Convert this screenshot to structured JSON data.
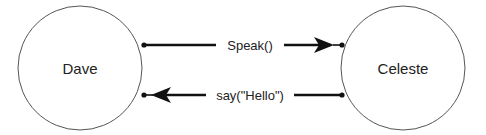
{
  "diagram": {
    "nodes": [
      {
        "id": "dave",
        "label": "Dave"
      },
      {
        "id": "celeste",
        "label": "Celeste"
      }
    ],
    "messages": [
      {
        "label": "Speak()",
        "from": "dave",
        "to": "celeste",
        "arrowhead_near": "celeste"
      },
      {
        "label": "say(\"Hello\")",
        "from": "celeste",
        "to": "dave",
        "arrowhead_near": "dave"
      }
    ],
    "colors": {
      "stroke": "#111111",
      "circle_stroke": "#555555",
      "background": "#ffffff"
    }
  }
}
